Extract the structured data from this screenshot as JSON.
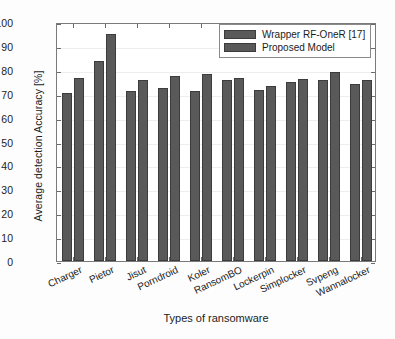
{
  "chart_data": {
    "type": "bar",
    "title": "",
    "xlabel": "Types of ransomware",
    "ylabel": "Average detection Accuracy [%]",
    "categories": [
      "Charger",
      "Pietor",
      "Jisut",
      "Porndroid",
      "Koler",
      "RansomBO",
      "Lockerpin",
      "Simplocker",
      "Svpeng",
      "Wannalocker"
    ],
    "series": [
      {
        "name": "Wrapper RF-OneR [17]",
        "color": "#595959",
        "values": [
          70.2,
          83.6,
          71.3,
          72.5,
          71.0,
          75.8,
          71.5,
          75.0,
          75.7,
          73.9
        ]
      },
      {
        "name": "Proposed Model",
        "color": "#595959",
        "values": [
          76.4,
          95.1,
          75.6,
          77.3,
          78.4,
          76.4,
          73.2,
          76.3,
          79.2,
          75.6
        ]
      }
    ],
    "ylim": [
      0,
      100
    ],
    "yticks": [
      0,
      10,
      20,
      30,
      40,
      50,
      60,
      70,
      80,
      90,
      100
    ],
    "ytick_labels": [
      "0",
      "10",
      "20",
      "30",
      "40",
      "50",
      "60",
      "70",
      "80",
      "90",
      "100"
    ],
    "grid": true,
    "legend_position": "top-right"
  },
  "legend": {
    "entries": [
      {
        "label": "Wrapper RF-OneR [17]"
      },
      {
        "label": "Proposed Model"
      }
    ]
  }
}
